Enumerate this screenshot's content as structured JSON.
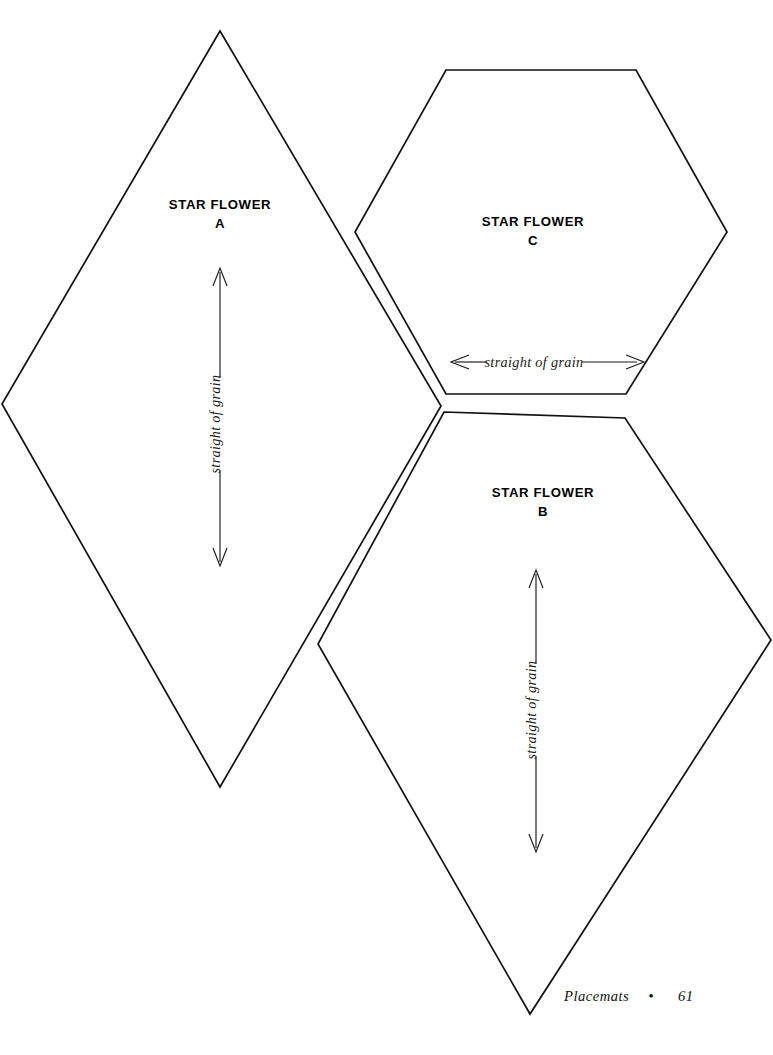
{
  "page": {
    "background_color": "#ffffff",
    "ink_color": "#111111",
    "width": 773,
    "height": 1055
  },
  "footer": {
    "section": "Placemats",
    "separator": "•",
    "page_number": "61"
  },
  "pieces": [
    {
      "id": "a",
      "title": "STAR FLOWER",
      "letter": "A",
      "shape": "diamond",
      "grain": {
        "label": "straight of grain",
        "orientation": "vertical",
        "arrow": "double-headed"
      }
    },
    {
      "id": "b",
      "title": "STAR FLOWER",
      "letter": "B",
      "shape": "pentagon-kite",
      "grain": {
        "label": "straight of grain",
        "orientation": "vertical",
        "arrow": "double-headed"
      }
    },
    {
      "id": "c",
      "title": "STAR FLOWER",
      "letter": "C",
      "shape": "hexagon",
      "grain": {
        "label": "straight of grain",
        "orientation": "horizontal",
        "arrow": "double-headed"
      }
    }
  ],
  "geometry": {
    "piece_a_points": "220,31 441,406 220,787 2,404",
    "piece_c_points": "446,70 636,70 727,232 626,394 446,394 355,232",
    "piece_b_points": "444,412 625,418 771,640 530,1014 318,644"
  }
}
